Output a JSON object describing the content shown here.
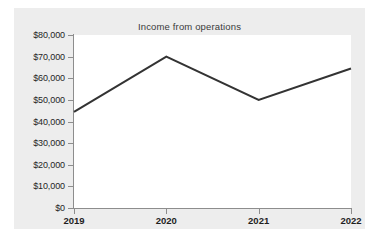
{
  "chart_data": {
    "type": "line",
    "title": "Income from operations",
    "xlabel": "",
    "ylabel": "",
    "categories": [
      "2019",
      "2020",
      "2021",
      "2022"
    ],
    "x": [
      2019,
      2020,
      2021,
      2022
    ],
    "values": [
      44500,
      70000,
      50000,
      64500
    ],
    "series": [
      {
        "name": "Income from operations",
        "values": [
          44500,
          70000,
          50000,
          64500
        ],
        "color": "#333333"
      }
    ],
    "ylim": [
      0,
      80000
    ],
    "ytick_values": [
      0,
      10000,
      20000,
      30000,
      40000,
      50000,
      60000,
      70000,
      80000
    ],
    "ytick_labels": [
      "$0",
      "$10,000",
      "$20,000",
      "$30,000",
      "$40,000",
      "$50,000",
      "$60,000",
      "$70,000",
      "$80,000"
    ],
    "xtick_labels": [
      "2019",
      "2020",
      "2021",
      "2022"
    ],
    "grid": false,
    "legend": false,
    "legend_position": "none",
    "markers": false,
    "currency_prefix": "$",
    "figure_background": "#ededed",
    "plot_background": "#ffffff",
    "axis_color": "#8d8d8d",
    "text_color": "#1f1f1f",
    "title_color": "#3a3a3a"
  }
}
